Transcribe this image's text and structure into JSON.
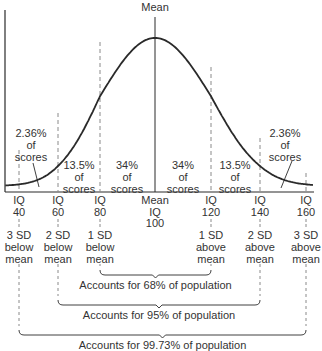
{
  "title": "Mean",
  "colors": {
    "ink": "#2a2a2a",
    "dash": "#8a8a8a"
  },
  "chart_data": {
    "type": "line",
    "distribution": {
      "mean": 100,
      "sd": 20
    },
    "x_ticks": [
      40,
      60,
      80,
      100,
      120,
      140,
      160
    ],
    "x_tick_labels": [
      {
        "line1": "IQ",
        "line2": "40"
      },
      {
        "line1": "IQ",
        "line2": "60"
      },
      {
        "line1": "IQ",
        "line2": "80"
      },
      {
        "line1": "Mean",
        "line2": "IQ",
        "line3": "100"
      },
      {
        "line1": "IQ",
        "line2": "120"
      },
      {
        "line1": "IQ",
        "line2": "140"
      },
      {
        "line1": "IQ",
        "line2": "160"
      }
    ],
    "xlim": [
      33,
      163
    ],
    "regions": [
      {
        "range": [
          40,
          60
        ],
        "label": "2.36%\nof\nscores",
        "percent": 2.36
      },
      {
        "range": [
          60,
          80
        ],
        "label": "13.5%\nof\nscores",
        "percent": 13.5
      },
      {
        "range": [
          80,
          100
        ],
        "label": "34%\nof\nscores",
        "percent": 34
      },
      {
        "range": [
          100,
          120
        ],
        "label": "34%\nof\nscores",
        "percent": 34
      },
      {
        "range": [
          120,
          140
        ],
        "label": "13.5%\nof\nscores",
        "percent": 13.5
      },
      {
        "range": [
          140,
          160
        ],
        "label": "2.36%\nof\nscores",
        "percent": 2.36
      }
    ],
    "sd_labels": [
      "3 SD\nbelow\nmean",
      "2 SD\nbelow\nmean",
      "1 SD\nbelow\nmean",
      "1 SD\nabove\nmean",
      "2 SD\nabove\nmean",
      "3 SD\nabove\nmean"
    ],
    "brackets": [
      {
        "from": 80,
        "to": 120,
        "label": "Accounts for 68% of population",
        "percent": 68
      },
      {
        "from": 60,
        "to": 140,
        "label": "Accounts for 95% of population",
        "percent": 95
      },
      {
        "from": 40,
        "to": 160,
        "label": "Accounts for 99.73% of population",
        "percent": 99.73
      }
    ]
  }
}
